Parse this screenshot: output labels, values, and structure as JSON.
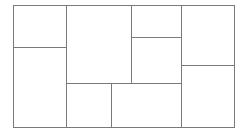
{
  "diagram": {
    "type": "rectangle-partition",
    "line_color": "#7a7a7a",
    "background": "#ffffff",
    "outer": {
      "x": 13,
      "y": 5,
      "w": 222,
      "h": 123
    },
    "cells": [
      {
        "id": "a-top",
        "x": 13,
        "y": 5,
        "w": 54,
        "h": 43
      },
      {
        "id": "a-bottom",
        "x": 13,
        "y": 47,
        "w": 54,
        "h": 81
      },
      {
        "id": "b-big",
        "x": 66,
        "y": 5,
        "w": 66,
        "h": 79
      },
      {
        "id": "b-small-top",
        "x": 131,
        "y": 5,
        "w": 51,
        "h": 33
      },
      {
        "id": "b-small-mid",
        "x": 131,
        "y": 37,
        "w": 51,
        "h": 47
      },
      {
        "id": "b-bottom-left",
        "x": 66,
        "y": 83,
        "w": 46,
        "h": 45
      },
      {
        "id": "b-bottom-right",
        "x": 111,
        "y": 83,
        "w": 71,
        "h": 45
      },
      {
        "id": "c-top",
        "x": 181,
        "y": 5,
        "w": 54,
        "h": 61
      },
      {
        "id": "c-bottom",
        "x": 181,
        "y": 65,
        "w": 54,
        "h": 63
      }
    ]
  }
}
